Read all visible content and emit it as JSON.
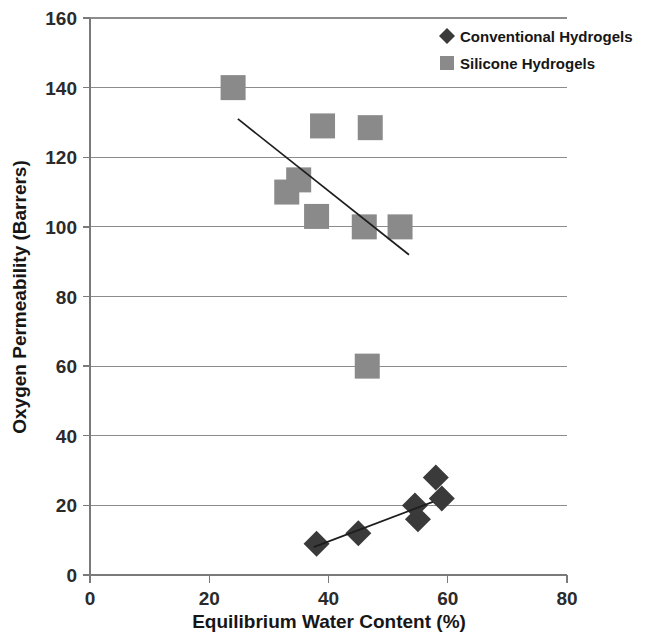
{
  "chart_data": {
    "type": "scatter",
    "title": "",
    "xlabel": "Equilibrium Water Content (%)",
    "ylabel": "Oxygen Permeability (Barrers)",
    "xlim": [
      0,
      80
    ],
    "ylim": [
      0,
      160
    ],
    "xticks": [
      0,
      20,
      40,
      60,
      80
    ],
    "yticks": [
      0,
      20,
      40,
      60,
      80,
      100,
      120,
      140,
      160
    ],
    "xtick_labels": [
      "0",
      "20",
      "40",
      "60",
      "80"
    ],
    "ytick_labels": [
      "0",
      "20",
      "40",
      "60",
      "80",
      "100",
      "120",
      "140",
      "160"
    ],
    "grid": "horizontal",
    "legend_position": "top-right",
    "series": [
      {
        "name": "Conventional Hydrogels",
        "marker": "diamond",
        "color": "#3a3a3a",
        "points": [
          {
            "x": 38.0,
            "y": 9
          },
          {
            "x": 45.0,
            "y": 12
          },
          {
            "x": 54.5,
            "y": 20
          },
          {
            "x": 55.0,
            "y": 16
          },
          {
            "x": 58.0,
            "y": 28
          },
          {
            "x": 59.0,
            "y": 22
          }
        ],
        "trendline": {
          "x1": 37.5,
          "y1": 8.0,
          "x2": 57.5,
          "y2": 21.0
        }
      },
      {
        "name": "Silicone Hydrogels",
        "marker": "square",
        "color": "#8a8a8a",
        "points": [
          {
            "x": 24.0,
            "y": 140
          },
          {
            "x": 39.0,
            "y": 129
          },
          {
            "x": 47.0,
            "y": 128.5
          },
          {
            "x": 33.0,
            "y": 110
          },
          {
            "x": 35.0,
            "y": 113.5
          },
          {
            "x": 38.0,
            "y": 103
          },
          {
            "x": 46.0,
            "y": 100
          },
          {
            "x": 52.0,
            "y": 100
          },
          {
            "x": 46.5,
            "y": 60
          }
        ],
        "trendline": {
          "x1": 24.8,
          "y1": 131.0,
          "x2": 53.5,
          "y2": 92.0
        }
      }
    ]
  },
  "legend": {
    "entries": [
      {
        "label": "Conventional Hydrogels",
        "marker": "diamond",
        "color": "#3a3a3a"
      },
      {
        "label": "Silicone Hydrogels",
        "marker": "square",
        "color": "#8a8a8a"
      }
    ]
  },
  "colors": {
    "conventional": "#3a3a3a",
    "silicone": "#8a8a8a",
    "gridline": "#8c8c8c",
    "axis": "#7a7a7a",
    "text": "#161616",
    "background": "#ffffff"
  }
}
